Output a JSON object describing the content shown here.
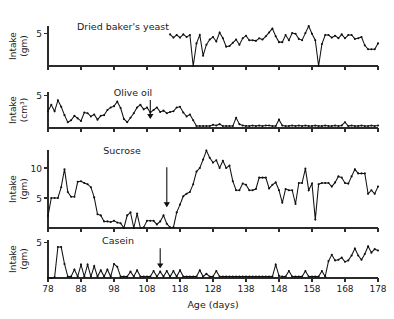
{
  "figure": {
    "xlabel": "Age (days)",
    "xlim": [
      78,
      178
    ],
    "xticks": [
      78,
      88,
      98,
      108,
      118,
      128,
      138,
      148,
      158,
      168,
      178
    ],
    "xticklabels": [
      "78",
      "88",
      "98",
      "108",
      "118",
      "128",
      "138",
      "148",
      "158",
      "168",
      "178"
    ]
  },
  "chart_data": {
    "type": "line",
    "title": "",
    "xlabel": "Age (days)",
    "ylabel": "Intake",
    "x": [
      78,
      79,
      80,
      81,
      82,
      83,
      84,
      85,
      86,
      87,
      88,
      89,
      90,
      91,
      92,
      93,
      94,
      95,
      96,
      97,
      98,
      99,
      100,
      101,
      102,
      103,
      104,
      105,
      106,
      107,
      108,
      109,
      110,
      111,
      112,
      113,
      114,
      115,
      116,
      117,
      118,
      119,
      120,
      121,
      122,
      123,
      124,
      125,
      126,
      127,
      128,
      129,
      130,
      131,
      132,
      133,
      134,
      135,
      136,
      137,
      138,
      139,
      140,
      141,
      142,
      143,
      144,
      145,
      146,
      147,
      148,
      149,
      150,
      151,
      152,
      153,
      154,
      155,
      156,
      157,
      158,
      159,
      160,
      161,
      162,
      163,
      164,
      165,
      166,
      167,
      168,
      169,
      170,
      171,
      172,
      173,
      174,
      175,
      176,
      177,
      178
    ],
    "xlim": [
      78,
      178
    ],
    "grid": false,
    "legend": "none",
    "panels": [
      {
        "name": "dried-bakers-yeast",
        "label": "Dried baker's yeast",
        "ylabel_lines": [
          "Intake",
          "(gm)"
        ],
        "units": "gm",
        "ylim": [
          0,
          6.2
        ],
        "yticks": [
          5
        ],
        "yticklabels": [
          "5"
        ],
        "title_x": 123,
        "arrows": [],
        "x_start": 115,
        "values": [
          4.9,
          4.4,
          4.8,
          4.4,
          4.9,
          4.5,
          4.8,
          0.0,
          3.5,
          4.8,
          1.6,
          3.3,
          4.1,
          4.5,
          3.8,
          5.2,
          4.3,
          3.0,
          3.1,
          3.6,
          4.1,
          3.3,
          4.3,
          4.7,
          4.0,
          4.0,
          3.9,
          4.3,
          4.1,
          4.6,
          5.2,
          5.8,
          4.6,
          3.7,
          3.7,
          4.8,
          4.0,
          5.1,
          5.0,
          4.2,
          4.0,
          5.1,
          6.2,
          5.0,
          4.0,
          0.0,
          3.4,
          4.8,
          4.8,
          4.4,
          4.7,
          4.3,
          4.9,
          4.3,
          4.8,
          4.8,
          4.2,
          4.3,
          4.5,
          3.2,
          2.6,
          2.6,
          2.6,
          3.5,
          2.4,
          4.0,
          2.5,
          3.8,
          2.6,
          3.6,
          2.6,
          3.3,
          2.7
        ]
      },
      {
        "name": "olive-oil",
        "label": "Olive oil",
        "ylabel_lines": [
          "Intake",
          "(cm3)"
        ],
        "units": "cm3",
        "ylim": [
          0,
          5.6
        ],
        "yticks": [
          5
        ],
        "yticklabels": [
          "5"
        ],
        "title_x": 133,
        "arrows": [
          {
            "x": 109,
            "label": "intervention"
          }
        ],
        "x_start": 78,
        "values": [
          2.6,
          3.6,
          2.6,
          4.3,
          3.3,
          2.0,
          0.9,
          1.2,
          1.9,
          1.5,
          1.1,
          2.4,
          2.3,
          1.8,
          2.1,
          1.3,
          1.9,
          2.0,
          2.8,
          3.2,
          3.4,
          4.1,
          3.1,
          1.4,
          0.9,
          1.6,
          2.3,
          3.2,
          3.6,
          2.9,
          3.2,
          2.4,
          2.8,
          3.2,
          2.5,
          2.7,
          2.3,
          2.5,
          2.6,
          3.2,
          3.3,
          2.4,
          1.8,
          2.1,
          1.2,
          0.3,
          0.3,
          0.3,
          0.3,
          0.3,
          0.5,
          0.4,
          0.6,
          0.3,
          0.3,
          0.3,
          0.3,
          1.6,
          0.6,
          0.4,
          0.3,
          0.3,
          0.4,
          0.3,
          0.4,
          0.3,
          0.4,
          0.4,
          0.3,
          0.3,
          1.3,
          0.4,
          0.3,
          0.3,
          0.4,
          0.3,
          0.4,
          0.3,
          0.4,
          0.3,
          0.3,
          0.4,
          0.3,
          0.3,
          0.4,
          0.3,
          0.3,
          0.4,
          0.3,
          0.4,
          0.9,
          0.3,
          0.4,
          0.3,
          0.3,
          0.4,
          0.3,
          0.3,
          0.4,
          0.3,
          0.4
        ]
      },
      {
        "name": "sucrose",
        "label": "Sucrose",
        "ylabel_lines": [
          "Intake",
          "(gm)"
        ],
        "units": "gm",
        "ylim": [
          0,
          13.0
        ],
        "yticks": [
          5,
          10
        ],
        "yticklabels": [
          "5",
          "10"
        ],
        "title_x": 122,
        "arrows": [
          {
            "x": 114,
            "label": "intervention"
          }
        ],
        "x_start": 78,
        "values": [
          2.0,
          5.0,
          5.0,
          5.0,
          6.8,
          9.8,
          6.0,
          5.2,
          5.2,
          7.7,
          7.8,
          7.5,
          7.3,
          6.8,
          5.1,
          2.3,
          2.1,
          1.1,
          1.1,
          1.0,
          1.2,
          0.9,
          0.8,
          0.0,
          2.1,
          2.6,
          0.0,
          2.4,
          0.0,
          0.1,
          1.2,
          1.2,
          1.2,
          0.6,
          1.1,
          2.1,
          0.7,
          0.1,
          0.1,
          2.6,
          3.9,
          5.3,
          5.7,
          6.0,
          7.3,
          9.4,
          10.0,
          11.4,
          12.9,
          11.7,
          10.9,
          11.3,
          10.0,
          11.2,
          10.0,
          10.4,
          7.8,
          6.3,
          6.3,
          7.4,
          7.2,
          6.3,
          6.3,
          6.5,
          8.4,
          8.4,
          8.4,
          6.6,
          7.2,
          7.6,
          6.3,
          4.2,
          6.5,
          6.3,
          6.3,
          4.0,
          7.5,
          7.5,
          9.9,
          6.3,
          7.4,
          1.4,
          7.3,
          7.5,
          7.5,
          7.5,
          6.9,
          7.6,
          8.6,
          8.4,
          7.5,
          7.4,
          8.6,
          9.8,
          9.1,
          9.1,
          9.1,
          5.7,
          6.3,
          5.7,
          6.9
        ]
      },
      {
        "name": "casein",
        "label": "Casein",
        "ylabel_lines": [
          "Intake",
          "(gm)"
        ],
        "units": "gm",
        "ylim": [
          0,
          5.4
        ],
        "yticks": [
          5
        ],
        "yticklabels": [
          "5"
        ],
        "title_x": 118,
        "arrows": [
          {
            "x": 112,
            "label": "intervention"
          }
        ],
        "x_start": 78,
        "values": [
          0.0,
          0.0,
          0.1,
          4.4,
          4.4,
          2.0,
          0.2,
          0.2,
          1.2,
          0.2,
          1.9,
          0.2,
          1.9,
          0.2,
          1.7,
          0.2,
          1.1,
          0.2,
          1.2,
          0.2,
          2.0,
          1.6,
          0.2,
          0.2,
          0.2,
          0.9,
          0.2,
          1.1,
          0.2,
          0.2,
          0.2,
          0.2,
          1.0,
          0.2,
          0.9,
          0.2,
          1.0,
          0.2,
          1.0,
          0.2,
          1.1,
          0.2,
          0.2,
          0.2,
          0.2,
          0.2,
          1.1,
          0.2,
          0.6,
          0.2,
          0.2,
          1.0,
          0.2,
          0.2,
          0.2,
          0.2,
          0.2,
          0.2,
          0.2,
          0.2,
          0.2,
          0.2,
          0.2,
          0.2,
          0.2,
          0.2,
          0.2,
          0.2,
          0.2,
          1.9,
          0.3,
          0.2,
          0.2,
          1.0,
          0.2,
          0.2,
          0.2,
          0.2,
          1.0,
          0.2,
          0.2,
          0.2,
          0.2,
          1.0,
          0.2,
          2.4,
          3.3,
          2.5,
          2.6,
          2.9,
          2.3,
          2.5,
          3.2,
          4.2,
          3.2,
          2.6,
          3.4,
          4.5,
          3.6,
          4.1,
          3.9
        ]
      }
    ]
  }
}
